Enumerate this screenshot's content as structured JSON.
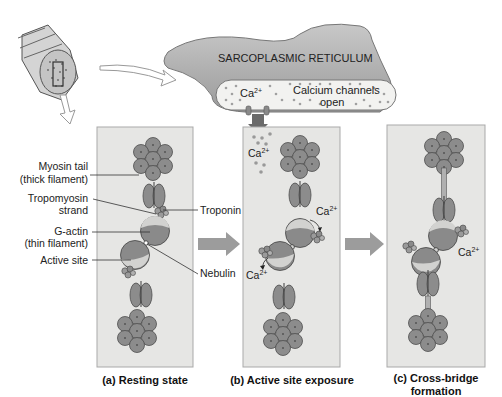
{
  "sarcoplasmic_reticulum": {
    "label": "SARCOPLASMIC RETICULUM",
    "ion": "Ca",
    "ion_charge": "2+",
    "channels_line1": "Calcium channels",
    "channels_line2": "open"
  },
  "panels": [
    {
      "id": "a",
      "caption_line1": "(a) Resting state",
      "caption_line2": ""
    },
    {
      "id": "b",
      "caption_line1": "(b) Active site exposure",
      "caption_line2": ""
    },
    {
      "id": "c",
      "caption_line1": "(c) Cross-bridge",
      "caption_line2": "formation"
    }
  ],
  "labels": {
    "myosin_tail_1": "Myosin tail",
    "myosin_tail_2": "(thick filament)",
    "tropomyosin_1": "Tropomyosin",
    "tropomyosin_2": "strand",
    "g_actin_1": "G-actin",
    "g_actin_2": "(thin filament)",
    "active_site": "Active site",
    "troponin": "Troponin",
    "nebulin": "Nebulin"
  },
  "ion_labels": {
    "ca": "Ca",
    "charge": "2+"
  },
  "colors": {
    "panel_bg": "#e6e6e4",
    "panel_border": "#a9a9a9",
    "myosin": "#8c8c8c",
    "myosin_dark": "#5c5c5c",
    "actin_light": "#d2d2d0",
    "arrow": "#9c9c9c",
    "sr_body": "#a8a8a8"
  }
}
